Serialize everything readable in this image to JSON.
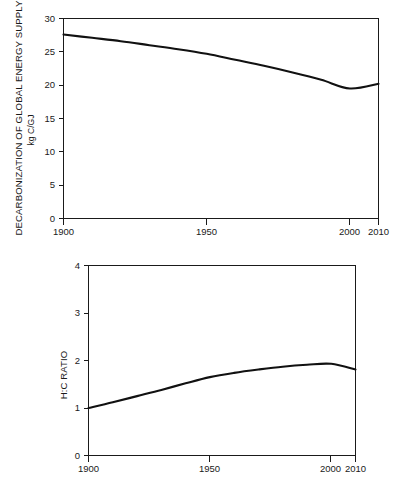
{
  "figure": {
    "background_color": "#ffffff",
    "line_color": "#111111",
    "axis_color": "#1a1a1a"
  },
  "chart_data": [
    {
      "id": "decarbonization",
      "type": "line",
      "title": "",
      "ylabel": "DECARBONIZATION OF GLOBAL ENERGY SUPPLY",
      "ylabel_units": "kg C/GJ",
      "xlabel": "",
      "xlim": [
        1900,
        2010
      ],
      "ylim": [
        0,
        30
      ],
      "yticks": [
        0,
        5,
        10,
        15,
        20,
        25,
        30
      ],
      "ytick_labels": [
        "0",
        "5",
        "10",
        "15",
        "20",
        "25",
        "30"
      ],
      "xticks": [
        1900,
        1950,
        2000,
        2010
      ],
      "xtick_labels": [
        "1900",
        "1950",
        "2000",
        "2010"
      ],
      "grid": false,
      "legend": null,
      "series": [
        {
          "name": "kg C/GJ",
          "x": [
            1900,
            1910,
            1920,
            1930,
            1940,
            1950,
            1960,
            1970,
            1980,
            1990,
            2000,
            2010
          ],
          "values": [
            27.6,
            27.1,
            26.6,
            26.0,
            25.4,
            24.7,
            23.8,
            22.9,
            21.9,
            20.8,
            19.5,
            20.2
          ]
        }
      ]
    },
    {
      "id": "hc-ratio",
      "type": "line",
      "title": "",
      "ylabel": "H:C RATIO",
      "ylabel_units": "",
      "xlabel": "",
      "xlim": [
        1900,
        2010
      ],
      "ylim": [
        0,
        4
      ],
      "yticks": [
        0,
        1,
        2,
        3,
        4
      ],
      "ytick_labels": [
        "0",
        "1",
        "2",
        "3",
        "4"
      ],
      "xticks": [
        1900,
        1950,
        2000,
        2010
      ],
      "xtick_labels": [
        "1900",
        "1950",
        "2000",
        "2010"
      ],
      "grid": false,
      "legend": null,
      "series": [
        {
          "name": "H:C ratio",
          "x": [
            1900,
            1910,
            1920,
            1930,
            1940,
            1950,
            1960,
            1970,
            1980,
            1990,
            2000,
            2010
          ],
          "values": [
            1.0,
            1.12,
            1.25,
            1.38,
            1.52,
            1.65,
            1.74,
            1.81,
            1.87,
            1.91,
            1.93,
            1.81
          ]
        }
      ]
    }
  ]
}
